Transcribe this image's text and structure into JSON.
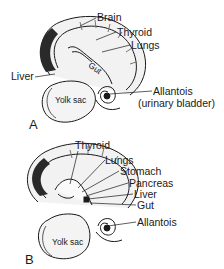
{
  "panels": [
    {
      "letter": "A",
      "labels": {
        "brain": "Brain",
        "thyroid": "Thyroid",
        "lungs": "Lungs",
        "gut": "Gut",
        "liver": "Liver",
        "yolk_sac": "Yolk sac",
        "allantois": "Allantois",
        "allantois_note": "(urinary bladder)"
      }
    },
    {
      "letter": "B",
      "labels": {
        "thyroid": "Thyroid",
        "lungs": "Lungs",
        "stomach": "Stomach",
        "pancreas": "Pancreas",
        "liver": "Liver",
        "gut": "Gut",
        "allantois": "Allantois",
        "yolk_sac": "Yolk sac"
      }
    }
  ]
}
